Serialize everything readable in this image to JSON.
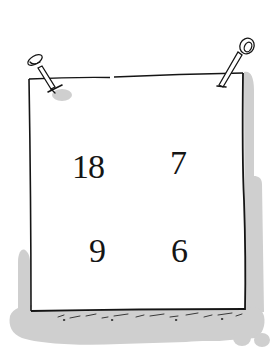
{
  "illustration": {
    "subject": "hand-drawn sign pinned with two nails",
    "colors": {
      "ink": "#151515",
      "paper": "#ffffff",
      "shadow": "#cfcfcf"
    },
    "numbers": {
      "top_left": "18",
      "top_right": "7",
      "bottom_left": "9",
      "bottom_right": "6"
    },
    "icons": {
      "left_pin": "nail-icon",
      "right_pin": "nail-icon"
    }
  }
}
